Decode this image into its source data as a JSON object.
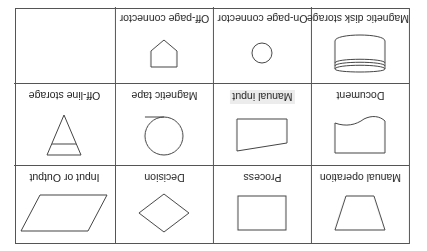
{
  "orientation": "rotated-180",
  "colors": {
    "line": "#555555",
    "text": "#222222",
    "background": "#ffffff",
    "label_highlight": "#ececec"
  },
  "rows": [
    [
      {
        "label": "Manual operation",
        "icon": "trapezoid-icon"
      },
      {
        "label": "Process",
        "icon": "rectangle-icon"
      },
      {
        "label": "Decision",
        "icon": "diamond-icon"
      },
      {
        "label": "Input or Output",
        "icon": "parallelogram-icon"
      }
    ],
    [
      {
        "label": "Document",
        "icon": "document-icon"
      },
      {
        "label": "Manual input",
        "icon": "manual-input-icon"
      },
      {
        "label": "Magnetic tape",
        "icon": "magnetic-tape-icon"
      },
      {
        "label": "Off-line storage",
        "icon": "triangle-icon"
      }
    ],
    [
      {
        "label": "Magnetic disk storage",
        "icon": "disk-storage-icon"
      },
      {
        "label": "On-page connector",
        "icon": "circle-icon"
      },
      {
        "label": "Off-page connector",
        "icon": "pentagon-icon"
      },
      {
        "label": "",
        "icon": ""
      }
    ]
  ]
}
